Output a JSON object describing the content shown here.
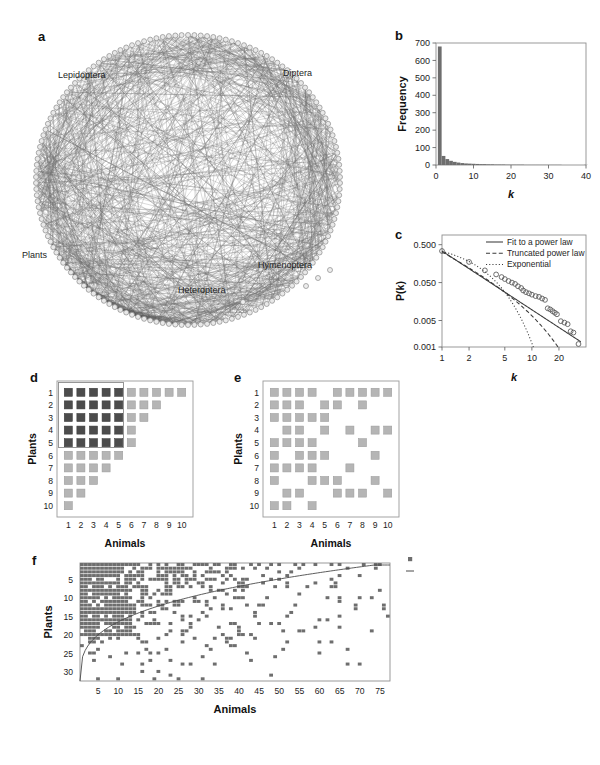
{
  "figure": {
    "panels": [
      "a",
      "b",
      "c",
      "d",
      "e",
      "f"
    ]
  },
  "panel_a": {
    "letter": "a",
    "type": "network-graph",
    "labels": [
      {
        "text": "Lepidoptera",
        "x": 58,
        "y": 57
      },
      {
        "text": "Diptera",
        "x": 283,
        "y": 55
      },
      {
        "text": "Plants",
        "x": 22,
        "y": 253
      },
      {
        "text": "Hymenoptera",
        "x": 258,
        "y": 261
      },
      {
        "text": "Heteroptera",
        "x": 178,
        "y": 286
      }
    ],
    "node_color": "#9a9a9a",
    "edge_color": "#6b6b6b"
  },
  "chart_data": [
    {
      "panel": "b",
      "type": "bar",
      "title": "",
      "xlabel": "k",
      "ylabel": "Frequency",
      "xlim": [
        0,
        40
      ],
      "ylim": [
        0,
        700
      ],
      "xticks": [
        0,
        10,
        20,
        30,
        40
      ],
      "yticks": [
        0,
        100,
        200,
        300,
        400,
        500,
        600,
        700
      ],
      "grid": false,
      "bar_color": "#6e6e6e",
      "categories": [
        1,
        2,
        3,
        4,
        5,
        6,
        7,
        8,
        9,
        10,
        11,
        12,
        13,
        14,
        15,
        16,
        17,
        18,
        19,
        20,
        21,
        22,
        23,
        24,
        25,
        26,
        27,
        28,
        29,
        30,
        31,
        32,
        33,
        34,
        35,
        36,
        37,
        38,
        39,
        40
      ],
      "values": [
        680,
        52,
        34,
        24,
        18,
        14,
        11,
        9,
        8,
        7,
        6,
        5,
        5,
        4,
        4,
        3,
        3,
        3,
        2,
        2,
        2,
        2,
        2,
        1,
        1,
        1,
        1,
        1,
        1,
        1,
        1,
        1,
        1,
        0,
        0,
        0,
        0,
        0,
        0,
        1
      ]
    },
    {
      "panel": "c",
      "type": "scatter",
      "title": "",
      "xlabel": "k",
      "ylabel": "P(k)",
      "xscale": "log",
      "yscale": "log",
      "xlim": [
        1,
        40
      ],
      "ylim": [
        0.001,
        0.9
      ],
      "xticks": [
        1,
        2,
        5,
        10,
        20
      ],
      "yticks": [
        0.001,
        0.005,
        0.05,
        0.5
      ],
      "ytick_labels": [
        "0.001",
        "0.005",
        "0.050",
        "0.500"
      ],
      "grid": false,
      "marker": "open-circle",
      "marker_color": "#555555",
      "legend_position": "top-right",
      "legend": [
        {
          "label": "Fit to a power law",
          "style": "solid"
        },
        {
          "label": "Truncated power law",
          "style": "dashed"
        },
        {
          "label": "Exponential",
          "style": "dotted"
        }
      ],
      "points": [
        {
          "k": 1,
          "p": 0.34
        },
        {
          "k": 2,
          "p": 0.175
        },
        {
          "k": 3,
          "p": 0.105
        },
        {
          "k": 4,
          "p": 0.082
        },
        {
          "k": 4.6,
          "p": 0.07
        },
        {
          "k": 5,
          "p": 0.062
        },
        {
          "k": 5.5,
          "p": 0.055
        },
        {
          "k": 6,
          "p": 0.05
        },
        {
          "k": 6.5,
          "p": 0.046
        },
        {
          "k": 7,
          "p": 0.04
        },
        {
          "k": 7.6,
          "p": 0.036
        },
        {
          "k": 8,
          "p": 0.031
        },
        {
          "k": 8.6,
          "p": 0.028
        },
        {
          "k": 9.3,
          "p": 0.026
        },
        {
          "k": 10,
          "p": 0.024
        },
        {
          "k": 11,
          "p": 0.022
        },
        {
          "k": 12,
          "p": 0.021
        },
        {
          "k": 13,
          "p": 0.019
        },
        {
          "k": 14,
          "p": 0.0175
        },
        {
          "k": 15,
          "p": 0.0105
        },
        {
          "k": 16,
          "p": 0.0098
        },
        {
          "k": 17,
          "p": 0.0088
        },
        {
          "k": 18,
          "p": 0.008
        },
        {
          "k": 19,
          "p": 0.0073
        },
        {
          "k": 21,
          "p": 0.0048
        },
        {
          "k": 23,
          "p": 0.0044
        },
        {
          "k": 25,
          "p": 0.004
        },
        {
          "k": 27,
          "p": 0.0026
        },
        {
          "k": 29,
          "p": 0.0024
        },
        {
          "k": 33,
          "p": 0.0012
        }
      ],
      "fit_power_law": {
        "exponent": -1.55,
        "coefficient": 0.34
      },
      "fit_truncated": {
        "exponent": -1.25,
        "cutoff": 9.0
      },
      "fit_exponential": {
        "rate": 0.62,
        "coefficient": 0.62
      }
    },
    {
      "panel": "d",
      "type": "heatmap",
      "title": "",
      "xlabel": "Animals",
      "ylabel": "Plants",
      "xticks": [
        1,
        2,
        3,
        4,
        5,
        6,
        7,
        8,
        9,
        10
      ],
      "yticks": [
        1,
        2,
        3,
        4,
        5,
        6,
        7,
        8,
        9,
        10
      ],
      "nrows": 10,
      "ncols": 10,
      "dark_color": "#4c4c4c",
      "light_color": "#b5b5b5",
      "core_rows": 5,
      "core_cols": 5,
      "matrix": [
        [
          1,
          1,
          1,
          1,
          1,
          1,
          1,
          1,
          1,
          1
        ],
        [
          1,
          1,
          1,
          1,
          1,
          1,
          1,
          1,
          0,
          0
        ],
        [
          1,
          1,
          1,
          1,
          1,
          1,
          1,
          0,
          0,
          0
        ],
        [
          1,
          1,
          1,
          1,
          1,
          1,
          0,
          0,
          0,
          0
        ],
        [
          1,
          1,
          1,
          1,
          1,
          1,
          0,
          0,
          0,
          0
        ],
        [
          1,
          1,
          1,
          1,
          1,
          0,
          0,
          0,
          0,
          0
        ],
        [
          1,
          1,
          1,
          1,
          0,
          0,
          0,
          0,
          0,
          0
        ],
        [
          1,
          1,
          1,
          0,
          0,
          0,
          0,
          0,
          0,
          0
        ],
        [
          1,
          1,
          0,
          0,
          0,
          0,
          0,
          0,
          0,
          0
        ],
        [
          1,
          0,
          0,
          0,
          0,
          0,
          0,
          0,
          0,
          0
        ]
      ]
    },
    {
      "panel": "e",
      "type": "heatmap",
      "title": "",
      "xlabel": "Animals",
      "ylabel": "Plants",
      "xticks": [
        1,
        2,
        3,
        4,
        5,
        6,
        7,
        8,
        9,
        10
      ],
      "yticks": [
        1,
        2,
        3,
        4,
        5,
        6,
        7,
        8,
        9,
        10
      ],
      "nrows": 10,
      "ncols": 10,
      "light_color": "#b5b5b5",
      "matrix": [
        [
          1,
          1,
          1,
          1,
          0,
          1,
          1,
          1,
          1,
          1
        ],
        [
          1,
          1,
          1,
          0,
          1,
          1,
          0,
          1,
          0,
          0
        ],
        [
          1,
          1,
          1,
          1,
          1,
          0,
          0,
          0,
          0,
          0
        ],
        [
          0,
          1,
          1,
          0,
          1,
          0,
          1,
          0,
          1,
          1
        ],
        [
          1,
          1,
          1,
          1,
          0,
          0,
          0,
          1,
          0,
          0
        ],
        [
          1,
          0,
          1,
          1,
          1,
          0,
          0,
          0,
          1,
          0
        ],
        [
          1,
          1,
          1,
          1,
          0,
          0,
          1,
          0,
          0,
          0
        ],
        [
          1,
          0,
          0,
          1,
          1,
          1,
          0,
          0,
          1,
          0
        ],
        [
          0,
          1,
          1,
          0,
          0,
          1,
          1,
          1,
          0,
          1
        ],
        [
          1,
          1,
          0,
          1,
          0,
          0,
          0,
          0,
          0,
          0
        ]
      ]
    },
    {
      "panel": "f",
      "type": "heatmap",
      "title": "",
      "xlabel": "Animals",
      "ylabel": "Plants",
      "xticks": [
        5,
        10,
        15,
        20,
        25,
        30,
        35,
        40,
        45,
        50,
        55,
        60,
        65,
        70,
        75
      ],
      "yticks": [
        5,
        10,
        15,
        20,
        25,
        30
      ],
      "nrows": 32,
      "ncols": 77,
      "cell_color": "#6e6e6e",
      "isocline_color": "#4a4a4a",
      "legend_position": "right",
      "legend": [
        {
          "label": "Observed interaction",
          "marker": "square"
        },
        {
          "label": "Isocline of perfect nestedness",
          "marker": "line"
        }
      ]
    }
  ]
}
